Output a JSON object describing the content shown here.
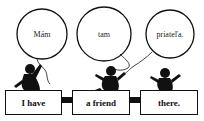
{
  "balloons": [
    {
      "text": "Mám"
    },
    {
      "text": "tam"
    },
    {
      "text": "priateľa."
    }
  ],
  "boxes": [
    {
      "text": "I have"
    },
    {
      "text": "a friend"
    },
    {
      "text": "there."
    }
  ]
}
